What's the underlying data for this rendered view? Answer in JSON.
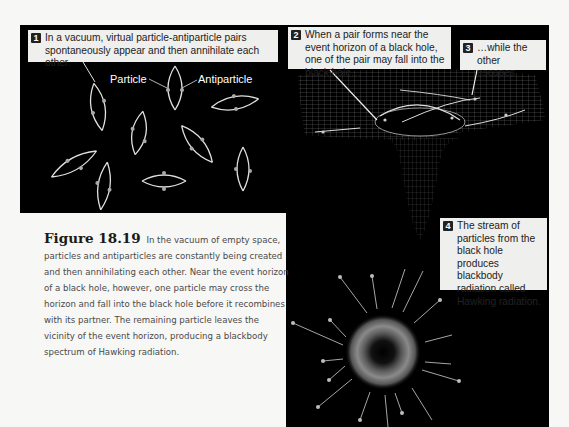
{
  "figure": {
    "label": "Figure 18.19",
    "caption": "In the vacuum of empty space, particles and antiparticles are constantly being created and then annihilating each other. Near the event horizon of a black hole, however, one particle may cross the horizon and fall into the black hole before it recombines with its partner. The remaining particle leaves the vicinity of the event horizon, producing a blackbody spectrum of Hawking radiation."
  },
  "callouts": [
    {
      "number": "1",
      "text": "In a vacuum, virtual particle-antiparticle pairs spontaneously appear and then annihilate each other."
    },
    {
      "number": "2",
      "text": "When a pair forms near the event horizon of a black hole, one of the pair may fall into the black hole…"
    },
    {
      "number": "3",
      "text": "…while the other escapes."
    },
    {
      "number": "4",
      "text": "The stream of particles from the black hole produces blackbody radiation called Hawking radiation."
    }
  ],
  "labels": {
    "particle": "Particle",
    "antiparticle": "Antiparticle"
  },
  "colors": {
    "background": "#000000",
    "page": "#f7f7f5",
    "callout_bg": "#efefed",
    "particle": "#bdbdbd"
  }
}
